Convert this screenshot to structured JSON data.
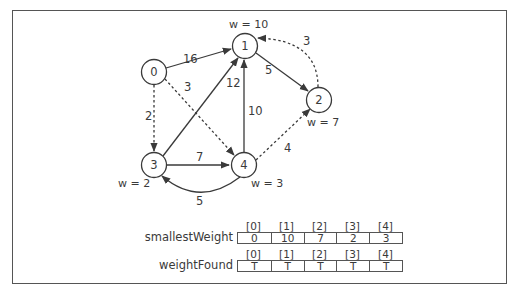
{
  "nodes": [
    {
      "id": "0",
      "label": "0",
      "weight_label": ""
    },
    {
      "id": "1",
      "label": "1",
      "weight_label": "w = 10"
    },
    {
      "id": "2",
      "label": "2",
      "weight_label": "w = 7"
    },
    {
      "id": "3",
      "label": "3",
      "weight_label": "w = 2"
    },
    {
      "id": "4",
      "label": "4",
      "weight_label": "w = 3"
    }
  ],
  "edges": [
    {
      "from": "0",
      "to": "1",
      "weight": "16",
      "style": "solid"
    },
    {
      "from": "0",
      "to": "3",
      "weight": "2",
      "style": "dashed"
    },
    {
      "from": "0",
      "to": "4",
      "weight": "3",
      "style": "dashed"
    },
    {
      "from": "1",
      "to": "2",
      "weight": "5",
      "style": "solid"
    },
    {
      "from": "2",
      "to": "1",
      "weight": "3",
      "style": "dashed"
    },
    {
      "from": "3",
      "to": "1",
      "weight": "12",
      "style": "solid"
    },
    {
      "from": "3",
      "to": "4",
      "weight": "7",
      "style": "solid"
    },
    {
      "from": "4",
      "to": "1",
      "weight": "10",
      "style": "solid"
    },
    {
      "from": "4",
      "to": "2",
      "weight": "4",
      "style": "dashed"
    },
    {
      "from": "4",
      "to": "3",
      "weight": "5",
      "style": "solid"
    }
  ],
  "arrays": {
    "smallestWeight": {
      "label": "smallestWeight",
      "indices": [
        "[0]",
        "[1]",
        "[2]",
        "[3]",
        "[4]"
      ],
      "values": [
        "0",
        "10",
        "7",
        "2",
        "3"
      ]
    },
    "weightFound": {
      "label": "weightFound",
      "indices": [
        "[0]",
        "[1]",
        "[2]",
        "[3]",
        "[4]"
      ],
      "values": [
        "T",
        "T",
        "T",
        "T",
        "T"
      ]
    }
  },
  "colors": {
    "stroke": "#3a3a3a",
    "frame": "#555555"
  }
}
